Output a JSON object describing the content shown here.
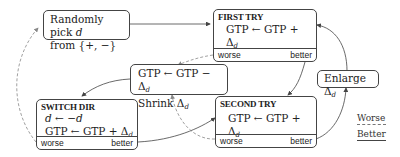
{
  "diagram": {
    "type": "state-machine",
    "nodes": {
      "random_pick": {
        "line1_prefix": "Randomly pick ",
        "line1_var": "d",
        "line2": "from {+, −}"
      },
      "first_try": {
        "title": "FIRST TRY",
        "update": "GTP ← GTP + Δ",
        "update_sub": "d",
        "worse_label": "worse",
        "better_label": "better"
      },
      "shrink": {
        "line1": "GTP ← GTP − Δ",
        "line1_sub": "d",
        "line2": "Shrink Δ",
        "line2_sub": "d"
      },
      "enlarge": {
        "line1": "Enlarge Δ",
        "line1_sub": "d"
      },
      "switch_dir": {
        "title": "SWITCH DIR",
        "line1": "d ← −d",
        "update": "GTP ← GTP + Δ",
        "update_sub": "d",
        "worse_label": "worse",
        "better_label": "better"
      },
      "second_try": {
        "title": "SECOND TRY",
        "update": "GTP ← GTP + Δ",
        "update_sub": "d",
        "worse_label": "worse",
        "better_label": "better"
      }
    },
    "edges": [
      {
        "from": "random_pick",
        "to": "first_try",
        "style": "solid"
      },
      {
        "from": "first_try.better",
        "to": "second_try",
        "style": "solid"
      },
      {
        "from": "first_try.worse",
        "to": "shrink",
        "style": "dashed"
      },
      {
        "from": "shrink",
        "to": "switch_dir",
        "style": "solid"
      },
      {
        "from": "switch_dir.worse",
        "to": "random_pick",
        "style": "dashed"
      },
      {
        "from": "switch_dir.better",
        "to": "second_try",
        "style": "solid"
      },
      {
        "from": "second_try.worse",
        "to": "shrink",
        "style": "dashed"
      },
      {
        "from": "second_try.better",
        "to": "enlarge",
        "style": "solid"
      },
      {
        "from": "enlarge",
        "to": "first_try",
        "style": "solid"
      }
    ],
    "legend": {
      "worse": "Worse",
      "better": "Better"
    },
    "colors": {
      "line": "#444444",
      "dashed": "#888888"
    }
  }
}
